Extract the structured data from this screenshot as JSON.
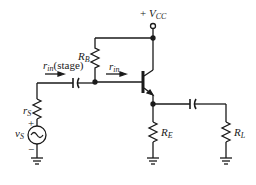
{
  "diagram": {
    "type": "common-collector amplifier (emitter follower)",
    "labels": {
      "vcc_sign": "+",
      "vcc_main": "V",
      "vcc_sub": "CC",
      "rb_main": "R",
      "rb_sub": "B",
      "rin_stage_main": "r",
      "rin_stage_sub": "in",
      "rin_stage_suffix": "(stage)",
      "rin_main": "r",
      "rin_sub": "in",
      "rs_main": "r",
      "rs_sub": "S",
      "vs_main": "v",
      "vs_sub": "S",
      "plus": "+",
      "minus": "−",
      "re_main": "R",
      "re_sub": "E",
      "rl_main": "R",
      "rl_sub": "L"
    },
    "components": [
      "V_CC supply",
      "R_B",
      "NPN transistor",
      "R_E",
      "coupling capacitor (input)",
      "coupling capacitor (output)",
      "R_L",
      "r_S",
      "v_S source",
      "ground x3"
    ],
    "colors": {
      "ink": "#1a1a1a",
      "background": "#ffffff"
    }
  }
}
